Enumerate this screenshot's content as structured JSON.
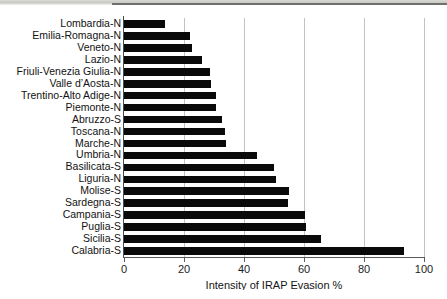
{
  "chart_data": {
    "type": "bar",
    "orientation": "horizontal",
    "title": "",
    "xlabel": "Intensity of IRAP Evasion %",
    "ylabel": "",
    "xlim": [
      0,
      100
    ],
    "xticks": [
      0,
      20,
      40,
      60,
      80,
      100
    ],
    "grid": "vertical",
    "legend": "none",
    "bar_color": "#0a0a0a",
    "categories": [
      "Lombardia-N",
      "Emilia-Romagna-N",
      "Veneto-N",
      "Lazio-N",
      "Friuli-Venezia Giulia-N",
      "Valle d’Aosta-N",
      "Trentino-Alto Adige-N",
      "Piemonte-N",
      "Abruzzo-S",
      "Toscana-N",
      "Marche-N",
      "Umbria-N",
      "Basilicata-S",
      "Liguria-N",
      "Molise-S",
      "Sardegna-S",
      "Campania-S",
      "Puglia-S",
      "Sicilia-S",
      "Calabria-S"
    ],
    "values": [
      13.7,
      22.0,
      22.5,
      26.0,
      28.7,
      29.0,
      30.5,
      30.7,
      32.5,
      33.7,
      34.0,
      44.4,
      50.0,
      50.8,
      55.0,
      54.7,
      60.3,
      60.8,
      65.8,
      93.3
    ]
  }
}
